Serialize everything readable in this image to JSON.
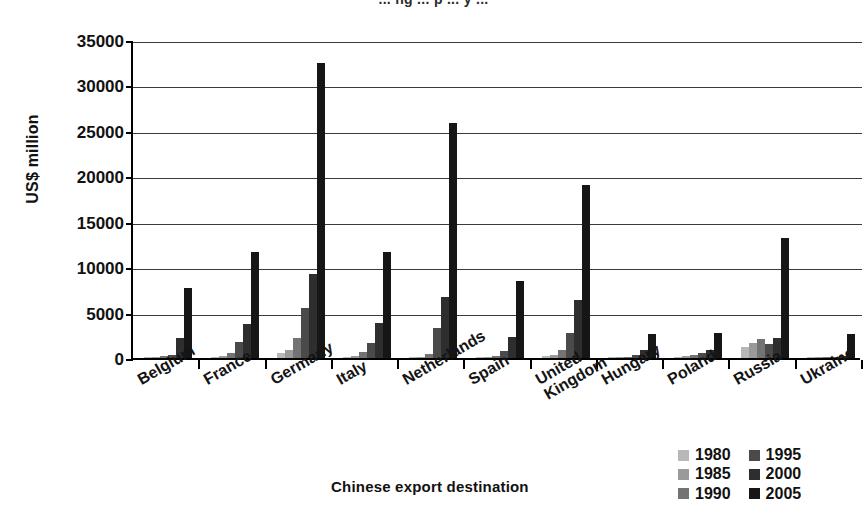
{
  "top_clipped_text": "... ng ... p ... y ...",
  "axis": {
    "y_title": "US$ million",
    "x_title": "Chinese export destination",
    "y_ticks": [
      "35000",
      "30000",
      "25000",
      "20000",
      "15000",
      "10000",
      "5000",
      "0"
    ]
  },
  "legend": {
    "items": [
      {
        "label": "1980",
        "color": "#b8b8b8"
      },
      {
        "label": "1995",
        "color": "#4a4a4a"
      },
      {
        "label": "1985",
        "color": "#9a9a9a"
      },
      {
        "label": "2000",
        "color": "#2e2e2e"
      },
      {
        "label": "1990",
        "color": "#737373"
      },
      {
        "label": "2005",
        "color": "#161616"
      }
    ]
  },
  "chart_data": {
    "type": "bar",
    "title": "",
    "xlabel": "Chinese export destination",
    "ylabel": "US$ million",
    "ylim": [
      0,
      35000
    ],
    "ytick_step": 5000,
    "grid": true,
    "legend_position": "bottom-right",
    "categories": [
      "Belgium",
      "France",
      "Germany",
      "Italy",
      "Netherlands",
      "Spain",
      "United Kingdom",
      "Hungary",
      "Poland",
      "Russia",
      "Ukraine"
    ],
    "series": [
      {
        "name": "1980",
        "color": "#b8b8b8",
        "values": [
          60,
          120,
          600,
          110,
          90,
          40,
          240,
          30,
          140,
          1250,
          20
        ]
      },
      {
        "name": "1985",
        "color": "#9a9a9a",
        "values": [
          80,
          180,
          850,
          200,
          150,
          70,
          330,
          40,
          190,
          1700,
          25
        ]
      },
      {
        "name": "1990",
        "color": "#737373",
        "values": [
          170,
          560,
          2150,
          620,
          420,
          180,
          900,
          80,
          290,
          2100,
          40
        ]
      },
      {
        "name": "1995",
        "color": "#4a4a4a",
        "values": [
          330,
          1800,
          5500,
          1700,
          3300,
          800,
          2800,
          350,
          500,
          1550,
          90
        ]
      },
      {
        "name": "2000",
        "color": "#2e2e2e",
        "values": [
          2250,
          3700,
          9300,
          3900,
          6700,
          2300,
          6400,
          850,
          850,
          2200,
          180
        ]
      },
      {
        "name": "2005",
        "color": "#161616",
        "values": [
          7700,
          11700,
          32500,
          11700,
          25900,
          8500,
          19000,
          2600,
          2800,
          13200,
          2600
        ]
      }
    ]
  }
}
